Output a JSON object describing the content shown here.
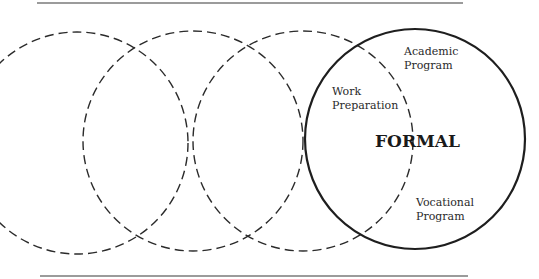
{
  "diagram": {
    "labels": {
      "academic_line1": "Academic",
      "academic_line2": "Program",
      "work_line1": "Work",
      "work_line2": "Preparation",
      "formal": "FORMAL",
      "vocational_line1": "Vocational",
      "vocational_line2": "Program"
    },
    "circles": [
      {
        "name": "dashed-circle-1",
        "style": "dashed"
      },
      {
        "name": "dashed-circle-2",
        "style": "dashed"
      },
      {
        "name": "dashed-circle-3",
        "style": "dashed"
      },
      {
        "name": "formal-circle",
        "style": "solid",
        "label": "FORMAL"
      }
    ],
    "colors": {
      "line": "#2b2b2b",
      "rule": "#7a7a7a",
      "background": "#ffffff"
    }
  }
}
